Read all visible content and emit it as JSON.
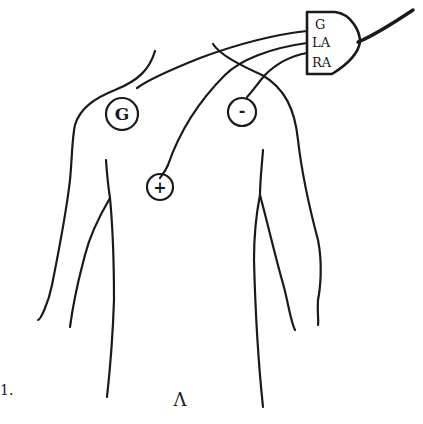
{
  "diagram": {
    "connector": {
      "labels": [
        "G",
        "LA",
        "RA"
      ]
    },
    "electrodes": [
      {
        "id": "ground",
        "symbol": "G"
      },
      {
        "id": "negative",
        "symbol": "-"
      },
      {
        "id": "positive",
        "symbol": "+"
      }
    ],
    "figure_label": "1.",
    "bottom_mark": "Λ"
  }
}
